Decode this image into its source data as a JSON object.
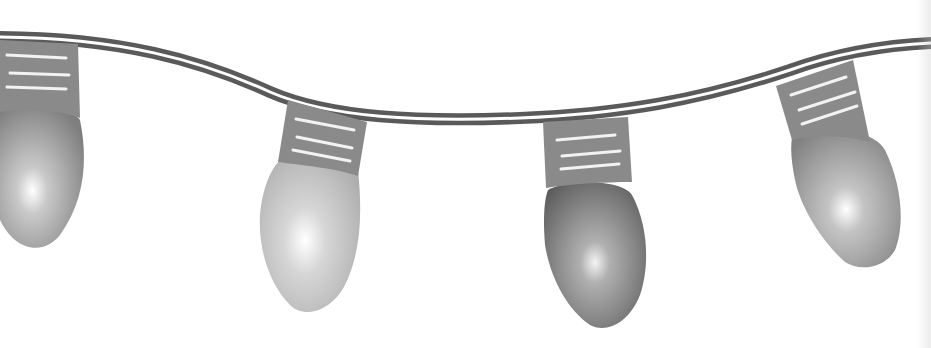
{
  "illustration": {
    "title": "String of Christmas lights",
    "description": "Grayscale clip-art of four bulbs hanging from a wavy double cord",
    "colors": {
      "cord": "#5a5a5a",
      "cord_highlight": "#ffffff",
      "socket": "#8a8a8a",
      "socket_lines": "#f2f2f2",
      "bulb_light": "#cfcfcf",
      "bulb_mid": "#9a9a9a",
      "bulb_dark": "#6e6e6e",
      "bulb_glow": "#ffffff",
      "background": "#ffffff"
    },
    "bulbs": [
      {
        "name": "bulb-1",
        "tone": "mid"
      },
      {
        "name": "bulb-2",
        "tone": "light"
      },
      {
        "name": "bulb-3",
        "tone": "dark"
      },
      {
        "name": "bulb-4",
        "tone": "mid"
      }
    ]
  }
}
